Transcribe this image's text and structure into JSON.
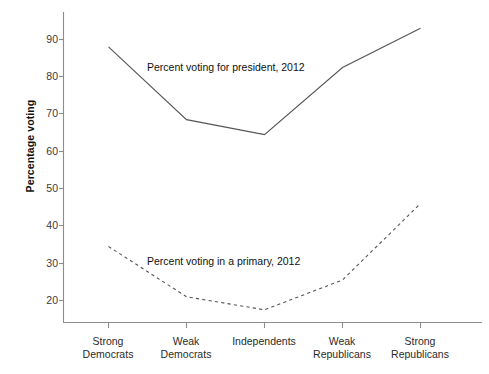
{
  "chart_data": {
    "type": "line",
    "title": "",
    "xlabel": "",
    "ylabel": "Percentage voting",
    "categories": [
      "Strong Democrats",
      "Weak Democrats",
      "Independents",
      "Weak Republicans",
      "Strong Republicans"
    ],
    "category_lines": [
      [
        "Strong",
        "Democrats"
      ],
      [
        "Weak",
        "Democrats"
      ],
      [
        "Independents",
        ""
      ],
      [
        "Weak",
        "Republicans"
      ],
      [
        "Strong",
        "Republicans"
      ]
    ],
    "series": [
      {
        "name": "Percent voting for president, 2012",
        "style": "solid",
        "color": "#555555",
        "values": [
          88,
          68.5,
          64.5,
          82.5,
          93
        ]
      },
      {
        "name": "Percent voting in a primary, 2012",
        "style": "dashed",
        "color": "#555555",
        "values": [
          34.5,
          21,
          17.5,
          25.5,
          46
        ]
      }
    ],
    "ylim": [
      15,
      95
    ],
    "yticks": [
      20,
      30,
      40,
      50,
      60,
      70,
      80,
      90
    ],
    "ytick_labels": [
      "20",
      "30",
      "40",
      "50",
      "60",
      "70",
      "80",
      "90"
    ],
    "grid": false,
    "legend_position": "inline-annotation",
    "annotations": [
      {
        "text": "Percent voting for president, 2012",
        "x": 147,
        "y": 68
      },
      {
        "text": "Percent voting in a primary, 2012",
        "x": 147,
        "y": 262
      }
    ]
  },
  "axes": {
    "left_spine_color": "#8c8c8c",
    "bottom_spine_color": "#8c8c8c",
    "tick_color": "#8c8c8c"
  }
}
